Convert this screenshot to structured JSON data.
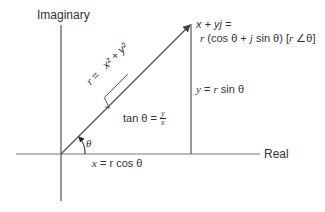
{
  "diagram": {
    "axes": {
      "vertical_label": "Imaginary",
      "horizontal_label": "Real"
    },
    "point": {
      "line1": "x + yj =",
      "line2_prefix": "r (cos θ + ",
      "line2_j": "j",
      "line2_mid": " sin θ) [",
      "line2_r": "r",
      "line2_suffix": " ∠θ]"
    },
    "magnitude": {
      "r": "r",
      "eq": " = ",
      "radicand": "x² + y²"
    },
    "vertical_side": {
      "y": "y",
      "eq": " = ",
      "r": "r",
      "rest": " sin θ"
    },
    "horizontal_side": {
      "x": "x",
      "rest": " = r cos θ"
    },
    "tangent": {
      "prefix": "tan θ = ",
      "numerator": "y",
      "denominator": "x"
    },
    "angle": {
      "symbol": "θ"
    },
    "colors": {
      "line": "#555555",
      "text": "#333333",
      "background": "#ffffff"
    }
  }
}
